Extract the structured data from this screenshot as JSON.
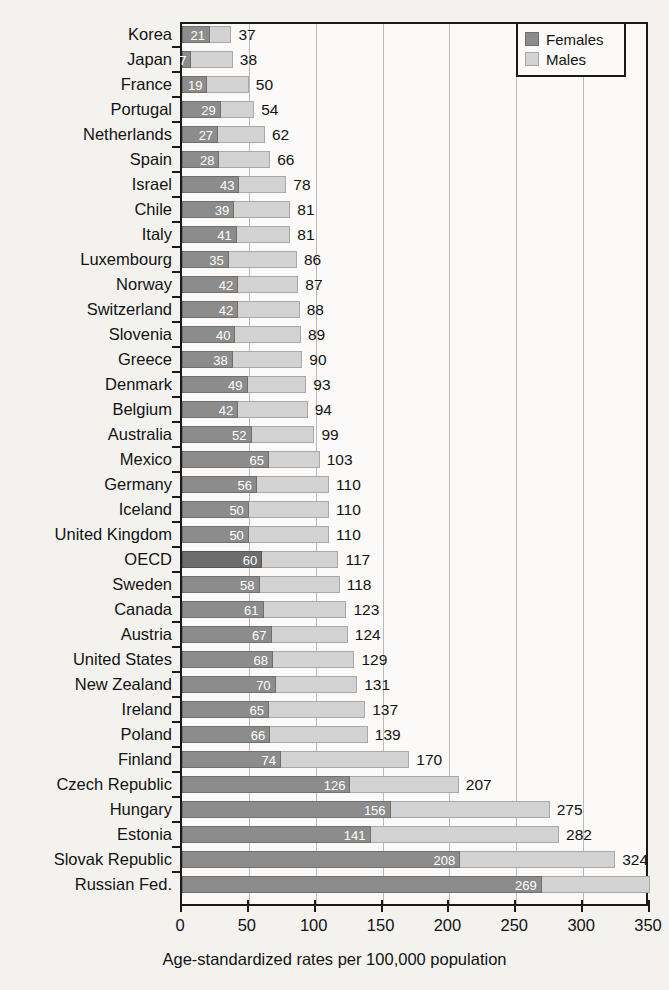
{
  "chart_data": {
    "type": "bar",
    "subtype": "stacked-horizontal",
    "title": "",
    "xlabel": "Age-standardized rates per 100,000 population",
    "ylabel": "",
    "xlim": [
      0,
      350
    ],
    "xticks": [
      0,
      50,
      100,
      150,
      200,
      250,
      300,
      350
    ],
    "grid": true,
    "legend_position": "top-right",
    "categories": [
      "Korea",
      "Japan",
      "France",
      "Portugal",
      "Netherlands",
      "Spain",
      "Israel",
      "Chile",
      "Italy",
      "Luxembourg",
      "Norway",
      "Switzerland",
      "Slovenia",
      "Greece",
      "Denmark",
      "Belgium",
      "Australia",
      "Mexico",
      "Germany",
      "Iceland",
      "United Kingdom",
      "OECD",
      "Sweden",
      "Canada",
      "Austria",
      "United States",
      "New Zealand",
      "Ireland",
      "Poland",
      "Finland",
      "Czech Republic",
      "Hungary",
      "Estonia",
      "Slovak Republic",
      "Russian Fed."
    ],
    "series": [
      {
        "name": "Females",
        "color": "#8c8c8c",
        "values": [
          21,
          7,
          19,
          29,
          27,
          28,
          43,
          39,
          41,
          35,
          42,
          42,
          40,
          38,
          49,
          42,
          52,
          65,
          56,
          50,
          50,
          60,
          58,
          61,
          67,
          68,
          70,
          65,
          66,
          74,
          126,
          156,
          141,
          208,
          269
        ]
      },
      {
        "name": "Males",
        "color": "#d2d2d2",
        "values": [
          16,
          31,
          31,
          25,
          35,
          38,
          35,
          42,
          40,
          51,
          45,
          46,
          49,
          52,
          44,
          52,
          47,
          38,
          54,
          60,
          60,
          57,
          60,
          62,
          57,
          61,
          61,
          72,
          73,
          96,
          81,
          119,
          141,
          116,
          81
        ]
      }
    ],
    "totals": [
      37,
      38,
      50,
      54,
      62,
      66,
      78,
      81,
      81,
      86,
      87,
      88,
      89,
      90,
      93,
      94,
      99,
      103,
      110,
      110,
      110,
      117,
      118,
      123,
      124,
      129,
      131,
      137,
      139,
      170,
      207,
      275,
      282,
      324,
      350
    ],
    "total_labels": [
      "37",
      "38",
      "50",
      "54",
      "62",
      "66",
      "78",
      "81",
      "81",
      "86",
      "87",
      "88",
      "89",
      "90",
      "93",
      "94",
      "99",
      "103",
      "110",
      "110",
      "110",
      "117",
      "118",
      "123",
      "124",
      "129",
      "131",
      "137",
      "139",
      "170",
      "207",
      "275",
      "282",
      "324",
      ""
    ],
    "highlight_category": "OECD"
  },
  "legend": {
    "items": [
      {
        "label": "Females",
        "swatch": "females-swatch"
      },
      {
        "label": "Males",
        "swatch": "males-swatch"
      }
    ]
  },
  "axis": {
    "x_title": "Age-standardized rates per 100,000 population",
    "x_tick_labels": [
      "0",
      "50",
      "100",
      "150",
      "200",
      "250",
      "300",
      "350"
    ]
  },
  "colors": {
    "females": "#8c8c8c",
    "males": "#d2d2d2",
    "females_highlight": "#6d6d6d",
    "axis": "#1a1a1a",
    "grid": "#b9b9b9",
    "background": "#f4f2ef",
    "plot_background": "#fbfaf8"
  }
}
